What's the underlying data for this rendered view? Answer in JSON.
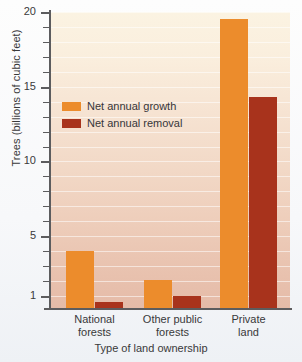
{
  "chart_data": {
    "type": "bar",
    "title": "",
    "xlabel": "Type of land ownership",
    "ylabel": "Trees (billions of cubic feet)",
    "categories": [
      "National forests",
      "Other public forests",
      "Private land"
    ],
    "series": [
      {
        "name": "Net annual growth",
        "color": "#ec8c2c",
        "values": [
          4.0,
          2.1,
          19.5
        ]
      },
      {
        "name": "Net annual removal",
        "color": "#a8331c",
        "values": [
          0.6,
          1.0,
          14.3
        ]
      }
    ],
    "ylim": [
      0,
      20
    ],
    "ytick_labels": [
      "20",
      "15",
      "10",
      "5",
      "1"
    ],
    "ytick_values": [
      20,
      15,
      10,
      5,
      1
    ],
    "yminor_step": 1,
    "grid": true,
    "legend_position": "inside-upper-left",
    "plot_background": "cream-to-salmon vertical gradient"
  },
  "axis": {
    "y_title": "Trees (billions of cubic feet)",
    "x_title": "Type of land ownership",
    "y_labels": [
      "20",
      "15",
      "10",
      "5",
      "1"
    ],
    "x_labels": [
      {
        "line1": "National",
        "line2": "forests"
      },
      {
        "line1": "Other public",
        "line2": "forests"
      },
      {
        "line1": "Private",
        "line2": "land"
      }
    ]
  },
  "legend": {
    "items": [
      {
        "label": "Net annual growth",
        "color": "#ec8c2c"
      },
      {
        "label": "Net annual removal",
        "color": "#a8331c"
      }
    ]
  }
}
